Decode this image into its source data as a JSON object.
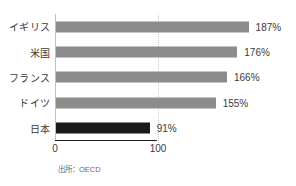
{
  "chart_data": {
    "type": "bar",
    "orientation": "horizontal",
    "title": "",
    "subtitle": "",
    "xlabel": "",
    "ylabel": "",
    "categories": [
      "イギリス",
      "米国",
      "フランス",
      "ドイツ",
      "日本"
    ],
    "values": [
      187,
      176,
      166,
      155,
      91
    ],
    "value_labels": [
      "187%",
      "176%",
      "166%",
      "155%",
      "91%"
    ],
    "unit": "%",
    "xlim": [
      0,
      200
    ],
    "xticks": [
      0,
      100
    ],
    "xtick_labels": [
      "0",
      "100"
    ],
    "gridlines": {
      "vertical_dotted_at": 100,
      "horizontal": false
    },
    "legend": {
      "visible": false,
      "position": "none"
    },
    "series": [
      {
        "name": "対GDP比",
        "values": [
          187,
          176,
          166,
          155,
          91
        ]
      }
    ],
    "bar_colors": [
      "#8c8c8c",
      "#8c8c8c",
      "#8c8c8c",
      "#8c8c8c",
      "#1a1a1a"
    ],
    "highlight_category": "日本",
    "annotations": []
  },
  "colors": {
    "bar_default": "#8c8c8c",
    "bar_highlight": "#1a1a1a",
    "axis": "#bfbfbf",
    "baseline": "#1f1f1f",
    "gridline": "#c4c4c4",
    "text": "#3a3a3a",
    "source_text": "#6a6a6a",
    "background": "#ffffff"
  },
  "axis": {
    "tick_0": "0",
    "tick_100": "100"
  },
  "footer": {
    "source": "出所：OECD"
  }
}
